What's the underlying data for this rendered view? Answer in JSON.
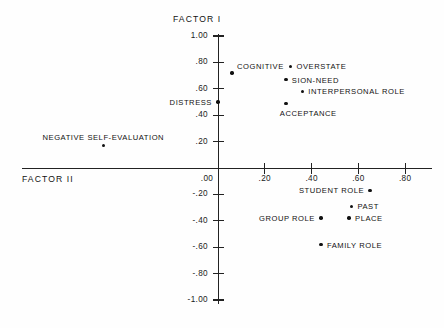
{
  "figure": {
    "axis_titles": {
      "vertical": "FACTOR I",
      "horizontal": "FACTOR II"
    }
  },
  "chart_data": {
    "type": "scatter",
    "title": "",
    "xlabel": "FACTOR II",
    "ylabel": "FACTOR I",
    "xlim": [
      0.0,
      0.9
    ],
    "ylim": [
      -1.0,
      1.0
    ],
    "grid": false,
    "legend": "none",
    "xticks": [
      ".00",
      ".20",
      ".40",
      ".60",
      ".80"
    ],
    "xtick_values": [
      0.0,
      0.2,
      0.4,
      0.6,
      0.8
    ],
    "yticks": [
      "1.00",
      ".80",
      ".60",
      ".40",
      ".20",
      ".00",
      "-.20",
      "-.40",
      "-.60",
      "-.80",
      "-1.00"
    ],
    "ytick_values": [
      1.0,
      0.8,
      0.6,
      0.4,
      0.2,
      0.0,
      -0.2,
      -0.4,
      -0.6,
      -0.8,
      -1.0
    ],
    "points": [
      {
        "label": "COGNITIVE",
        "x": 0.06,
        "y": 0.72
      },
      {
        "label": "OVERSTATE",
        "x": 0.31,
        "y": 0.77
      },
      {
        "label": "SION-NEED",
        "x": 0.29,
        "y": 0.67
      },
      {
        "label": "INTERPERSONAL ROLE",
        "x": 0.36,
        "y": 0.58
      },
      {
        "label": "ACCEPTANCE",
        "x": 0.29,
        "y": 0.49
      },
      {
        "label": "DISTRESS",
        "x": 0.0,
        "y": 0.5
      },
      {
        "label": "NEGATIVE SELF-EVALUATION",
        "x": -0.49,
        "y": 0.17
      },
      {
        "label": "STUDENT ROLE",
        "x": 0.65,
        "y": -0.17
      },
      {
        "label": "PAST",
        "x": 0.57,
        "y": -0.29
      },
      {
        "label": "PLACE",
        "x": 0.56,
        "y": -0.38
      },
      {
        "label": "GROUP ROLE",
        "x": 0.44,
        "y": -0.38
      },
      {
        "label": "FAMILY ROLE",
        "x": 0.44,
        "y": -0.58
      }
    ]
  }
}
